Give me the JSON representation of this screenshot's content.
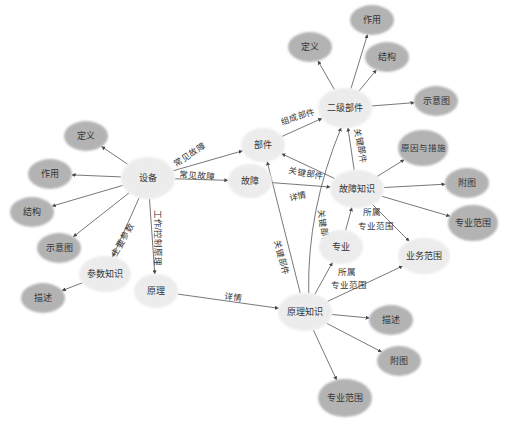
{
  "colors": {
    "primary_fill": "#ececec",
    "attribute_fill": "#b3b3b3",
    "edge": "#555555",
    "text": "#333333"
  },
  "nodes": [
    {
      "id": "shebei",
      "label": "设备",
      "x": 148,
      "y": 178,
      "rx": 27,
      "ry": 21,
      "type": "primary"
    },
    {
      "id": "dingyi_l",
      "label": "定义",
      "x": 86,
      "y": 136,
      "rx": 22,
      "ry": 15,
      "type": "attribute"
    },
    {
      "id": "zuoyong_l",
      "label": "作用",
      "x": 50,
      "y": 174,
      "rx": 22,
      "ry": 15,
      "type": "attribute"
    },
    {
      "id": "jiegou_l",
      "label": "结构",
      "x": 32,
      "y": 212,
      "rx": 22,
      "ry": 15,
      "type": "attribute"
    },
    {
      "id": "shiyitu_l",
      "label": "示意图",
      "x": 59,
      "y": 248,
      "rx": 22,
      "ry": 15,
      "type": "attribute"
    },
    {
      "id": "canshu",
      "label": "参数知识",
      "x": 105,
      "y": 274,
      "rx": 26,
      "ry": 18,
      "type": "primary"
    },
    {
      "id": "miaoshu_l",
      "label": "描述",
      "x": 43,
      "y": 298,
      "rx": 22,
      "ry": 15,
      "type": "attribute"
    },
    {
      "id": "yuanli",
      "label": "原理",
      "x": 156,
      "y": 291,
      "rx": 22,
      "ry": 17,
      "type": "primary"
    },
    {
      "id": "bujian",
      "label": "部件",
      "x": 263,
      "y": 145,
      "rx": 22,
      "ry": 17,
      "type": "primary"
    },
    {
      "id": "guzhang",
      "label": "故障",
      "x": 250,
      "y": 181,
      "rx": 22,
      "ry": 17,
      "type": "primary"
    },
    {
      "id": "erji",
      "label": "二级部件",
      "x": 345,
      "y": 108,
      "rx": 27,
      "ry": 20,
      "type": "primary"
    },
    {
      "id": "dingyi_t",
      "label": "定义",
      "x": 310,
      "y": 47,
      "rx": 22,
      "ry": 15,
      "type": "attribute"
    },
    {
      "id": "zuoyong_t",
      "label": "作用",
      "x": 372,
      "y": 20,
      "rx": 22,
      "ry": 15,
      "type": "attribute"
    },
    {
      "id": "jiegou_t",
      "label": "结构",
      "x": 387,
      "y": 57,
      "rx": 22,
      "ry": 15,
      "type": "attribute"
    },
    {
      "id": "shiyitu_t",
      "label": "示意图",
      "x": 436,
      "y": 101,
      "rx": 22,
      "ry": 15,
      "type": "attribute"
    },
    {
      "id": "yuanyin",
      "label": "原因与措施",
      "x": 423,
      "y": 148,
      "rx": 25,
      "ry": 18,
      "type": "attribute"
    },
    {
      "id": "guzhangzs",
      "label": "故障知识",
      "x": 357,
      "y": 189,
      "rx": 27,
      "ry": 19,
      "type": "primary"
    },
    {
      "id": "futu_r",
      "label": "附图",
      "x": 467,
      "y": 183,
      "rx": 22,
      "ry": 15,
      "type": "attribute"
    },
    {
      "id": "zhuanye_r",
      "label": "专业范围",
      "x": 473,
      "y": 223,
      "rx": 25,
      "ry": 18,
      "type": "attribute"
    },
    {
      "id": "zhuanye",
      "label": "专业",
      "x": 341,
      "y": 247,
      "rx": 22,
      "ry": 17,
      "type": "primary"
    },
    {
      "id": "yewu",
      "label": "业务范围",
      "x": 424,
      "y": 256,
      "rx": 26,
      "ry": 18,
      "type": "primary"
    },
    {
      "id": "yuanlizs",
      "label": "原理知识",
      "x": 305,
      "y": 312,
      "rx": 27,
      "ry": 19,
      "type": "primary"
    },
    {
      "id": "miaoshu_b",
      "label": "描述",
      "x": 391,
      "y": 320,
      "rx": 22,
      "ry": 15,
      "type": "attribute"
    },
    {
      "id": "futu_b",
      "label": "附图",
      "x": 399,
      "y": 361,
      "rx": 22,
      "ry": 15,
      "type": "attribute"
    },
    {
      "id": "zhuanye_b",
      "label": "专业范围",
      "x": 345,
      "y": 398,
      "rx": 27,
      "ry": 19,
      "type": "attribute"
    }
  ],
  "edges": [
    {
      "from": "shebei",
      "to": "dingyi_l",
      "label": ""
    },
    {
      "from": "shebei",
      "to": "zuoyong_l",
      "label": ""
    },
    {
      "from": "shebei",
      "to": "jiegou_l",
      "label": ""
    },
    {
      "from": "shebei",
      "to": "shiyitu_l",
      "label": ""
    },
    {
      "from": "shebei",
      "to": "canshu",
      "label": "主要参数"
    },
    {
      "from": "canshu",
      "to": "miaoshu_l",
      "label": ""
    },
    {
      "from": "shebei",
      "to": "yuanli",
      "label": "工作/控制原理"
    },
    {
      "from": "shebei",
      "to": "bujian",
      "label": "常见故障"
    },
    {
      "from": "shebei",
      "to": "guzhang",
      "label": "常见故障"
    },
    {
      "from": "bujian",
      "to": "erji",
      "label": "组成部件"
    },
    {
      "from": "guzhangzs",
      "to": "bujian",
      "label": "关键部件"
    },
    {
      "from": "guzhang",
      "to": "guzhangzs",
      "label": "详情"
    },
    {
      "from": "guzhangzs",
      "to": "erji",
      "label": "关键部件"
    },
    {
      "from": "erji",
      "to": "dingyi_t",
      "label": ""
    },
    {
      "from": "erji",
      "to": "zuoyong_t",
      "label": ""
    },
    {
      "from": "erji",
      "to": "jiegou_t",
      "label": ""
    },
    {
      "from": "erji",
      "to": "shiyitu_t",
      "label": ""
    },
    {
      "from": "guzhangzs",
      "to": "yuanyin",
      "label": ""
    },
    {
      "from": "guzhangzs",
      "to": "futu_r",
      "label": ""
    },
    {
      "from": "guzhangzs",
      "to": "zhuanye_r",
      "label": ""
    },
    {
      "from": "guzhangzs",
      "to": "yewu",
      "label": ""
    },
    {
      "from": "zhuanye",
      "to": "guzhangzs",
      "label": "所属\n专业范围"
    },
    {
      "from": "yuanli",
      "to": "yuanlizs",
      "label": "详情"
    },
    {
      "from": "yuanlizs",
      "to": "bujian",
      "label": "关键部件"
    },
    {
      "from": "yuanlizs",
      "to": "erji",
      "label": "关键部件",
      "curve": true
    },
    {
      "from": "yuanlizs",
      "to": "zhuanye",
      "label": "所属\n专业范围"
    },
    {
      "from": "yuanlizs",
      "to": "yewu",
      "label": ""
    },
    {
      "from": "yuanlizs",
      "to": "miaoshu_b",
      "label": ""
    },
    {
      "from": "yuanlizs",
      "to": "futu_b",
      "label": ""
    },
    {
      "from": "yuanlizs",
      "to": "zhuanye_b",
      "label": ""
    }
  ],
  "edge_labels": [
    {
      "text": "常见故障",
      "x": 190,
      "y": 155,
      "angle": -33
    },
    {
      "text": "常见故障",
      "x": 197,
      "y": 176,
      "angle": 6
    },
    {
      "text": "组成部件",
      "x": 298,
      "y": 117,
      "angle": -17
    },
    {
      "text": "关键部件",
      "x": 306,
      "y": 174,
      "angle": 10
    },
    {
      "text": "详情",
      "x": 298,
      "y": 197,
      "angle": -11
    },
    {
      "text": "关键部件",
      "x": 360,
      "y": 146,
      "angle": 80
    },
    {
      "text": "主要参数",
      "x": 123,
      "y": 240,
      "angle": -60
    },
    {
      "text": "工作/控制原理",
      "x": 157,
      "y": 238,
      "angle": 90
    },
    {
      "text": "关键部件",
      "x": 281,
      "y": 258,
      "angle": 75
    },
    {
      "text": "关键部件",
      "x": 323,
      "y": 228,
      "angle": 83
    },
    {
      "text": "所属",
      "x": 372,
      "y": 212,
      "angle": 0
    },
    {
      "text": "专业范围",
      "x": 376,
      "y": 226,
      "angle": 0
    },
    {
      "text": "所属",
      "x": 347,
      "y": 272,
      "angle": 0
    },
    {
      "text": "专业范围",
      "x": 349,
      "y": 285,
      "angle": 0
    },
    {
      "text": "详情",
      "x": 233,
      "y": 298,
      "angle": 8
    }
  ]
}
